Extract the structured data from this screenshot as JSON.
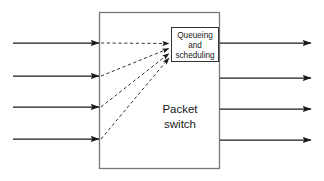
{
  "diagram": {
    "type": "block-diagram",
    "canvas": {
      "width": 324,
      "height": 181,
      "background": "#ffffff"
    },
    "colors": {
      "outer_box_border": "#777777",
      "inner_box_border": "#333333",
      "solid_arrow": "#1a1a1a",
      "dashed_arrow": "#444444",
      "text": "#1a1a1a",
      "background": "#ffffff"
    },
    "switch_box": {
      "label_lines": [
        "Packet",
        "switch"
      ],
      "x": 99,
      "y": 12,
      "width": 121,
      "height": 157
    },
    "queue_box": {
      "label_lines": [
        "Queueing",
        "and",
        "scheduling"
      ],
      "x": 171,
      "y": 27,
      "width": 48,
      "height": 35
    },
    "input_ports": [
      {
        "name": "input-1",
        "y": 43,
        "x_start": 13,
        "x_end": 99
      },
      {
        "name": "input-2",
        "y": 76,
        "x_start": 13,
        "x_end": 99
      },
      {
        "name": "input-3",
        "y": 107,
        "x_start": 13,
        "x_end": 99
      },
      {
        "name": "input-4",
        "y": 139,
        "x_start": 13,
        "x_end": 99
      }
    ],
    "output_ports": [
      {
        "name": "output-1",
        "y": 43,
        "x_start": 220,
        "x_end": 311
      },
      {
        "name": "output-2",
        "y": 78,
        "x_start": 220,
        "x_end": 311
      },
      {
        "name": "output-3",
        "y": 109,
        "x_start": 220,
        "x_end": 311
      },
      {
        "name": "output-4",
        "y": 140,
        "x_start": 220,
        "x_end": 311
      }
    ],
    "internal_paths": [
      {
        "name": "path-1",
        "from_x": 101,
        "from_y": 43,
        "to_x": 169,
        "to_y": 44
      },
      {
        "name": "path-2",
        "from_x": 101,
        "from_y": 76,
        "to_x": 169,
        "to_y": 49
      },
      {
        "name": "path-3",
        "from_x": 101,
        "from_y": 107,
        "to_x": 169,
        "to_y": 54
      },
      {
        "name": "path-4",
        "from_x": 101,
        "from_y": 139,
        "to_x": 169,
        "to_y": 58
      }
    ]
  }
}
